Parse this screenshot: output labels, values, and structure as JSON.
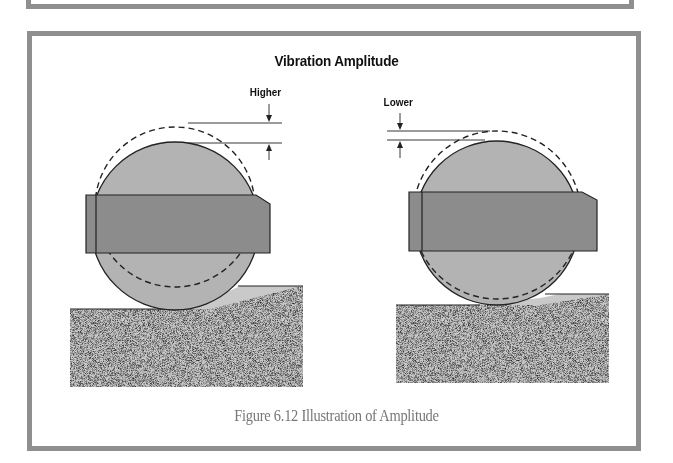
{
  "figure": {
    "title": "Vibration Amplitude",
    "caption": "Figure 6.12  Illustration of Amplitude",
    "panels": [
      {
        "id": "left",
        "label": "Higher",
        "description": "Roller with larger vibration amplitude; dashed outline displaced well above the solid roller"
      },
      {
        "id": "right",
        "label": "Lower",
        "description": "Roller with smaller vibration amplitude; dashed outline displaced slightly above the solid roller"
      }
    ]
  },
  "colors": {
    "frame": "#8f8f8f",
    "roller_fill": "#b3b3b3",
    "bar_fill": "#8c8c8c",
    "ground_fill": "#a6a6a6",
    "caption_text": "#777777",
    "outline": "#222222"
  }
}
